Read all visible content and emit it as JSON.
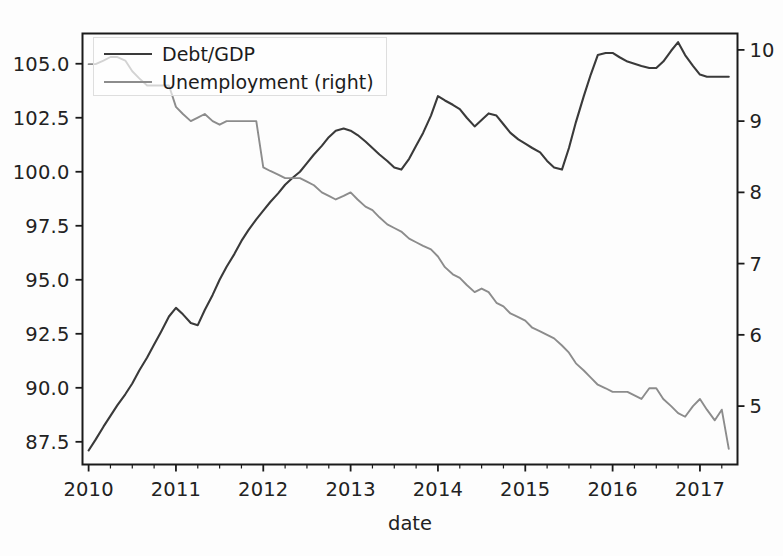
{
  "figure": {
    "background_color": "#fdfdfd",
    "axes_color": "#1a1a1a"
  },
  "legend": {
    "entries": [
      {
        "label": "Debt/GDP",
        "color": "#3a3a3a",
        "swatch": "line-swatch-debt"
      },
      {
        "label": "Unemployment (right)",
        "color": "#8c8c8c",
        "swatch": "line-swatch-unemployment"
      }
    ]
  },
  "axis": {
    "xlabel": "date",
    "xticks": [
      "2010",
      "2011",
      "2012",
      "2013",
      "2014",
      "2015",
      "2016",
      "2017"
    ],
    "yticks_left": [
      "105.0",
      "102.5",
      "100.0",
      "97.5",
      "95.0",
      "92.5",
      "90.0",
      "87.5"
    ],
    "yticks_right": [
      "10",
      "9",
      "8",
      "7",
      "6",
      "5"
    ]
  },
  "chart_data": {
    "type": "line",
    "title": "",
    "xlabel": "date",
    "ylabel": "",
    "ylabel_right": "",
    "grid": false,
    "legend_position": "upper left",
    "xlim": [
      2009.93,
      2017.43
    ],
    "ylim_left": [
      86.45,
      106.4
    ],
    "ylim_right": [
      4.18,
      10.23
    ],
    "xticks": [
      2010,
      2011,
      2012,
      2013,
      2014,
      2015,
      2016,
      2017
    ],
    "yticks_left": [
      87.5,
      90.0,
      92.5,
      95.0,
      97.5,
      100.0,
      102.5,
      105.0
    ],
    "yticks_right": [
      5,
      6,
      7,
      8,
      9,
      10
    ],
    "series": [
      {
        "name": "Debt/GDP",
        "axis": "left",
        "color": "#3a3a3a",
        "x": [
          2010.0,
          2010.08,
          2010.17,
          2010.25,
          2010.33,
          2010.42,
          2010.5,
          2010.58,
          2010.67,
          2010.75,
          2010.83,
          2010.92,
          2011.0,
          2011.08,
          2011.17,
          2011.25,
          2011.33,
          2011.42,
          2011.5,
          2011.58,
          2011.67,
          2011.75,
          2011.83,
          2011.92,
          2012.0,
          2012.08,
          2012.17,
          2012.25,
          2012.33,
          2012.42,
          2012.5,
          2012.58,
          2012.67,
          2012.75,
          2012.83,
          2012.92,
          2013.0,
          2013.08,
          2013.17,
          2013.25,
          2013.33,
          2013.42,
          2013.5,
          2013.58,
          2013.67,
          2013.75,
          2013.83,
          2013.92,
          2014.0,
          2014.08,
          2014.17,
          2014.25,
          2014.33,
          2014.42,
          2014.5,
          2014.58,
          2014.67,
          2014.75,
          2014.83,
          2014.92,
          2015.0,
          2015.08,
          2015.17,
          2015.25,
          2015.33,
          2015.42,
          2015.5,
          2015.58,
          2015.67,
          2015.75,
          2015.83,
          2015.92,
          2016.0,
          2016.08,
          2016.17,
          2016.25,
          2016.33,
          2016.42,
          2016.5,
          2016.58,
          2016.67,
          2016.75,
          2016.83,
          2016.92,
          2017.0,
          2017.08,
          2017.17,
          2017.25,
          2017.33
        ],
        "y": [
          87.1,
          87.6,
          88.2,
          88.7,
          89.2,
          89.7,
          90.2,
          90.8,
          91.4,
          92.0,
          92.6,
          93.3,
          93.7,
          93.4,
          93.0,
          92.9,
          93.6,
          94.3,
          95.0,
          95.6,
          96.2,
          96.8,
          97.3,
          97.8,
          98.2,
          98.6,
          99.0,
          99.4,
          99.7,
          100.0,
          100.4,
          100.8,
          101.2,
          101.6,
          101.9,
          102.0,
          101.9,
          101.7,
          101.4,
          101.1,
          100.8,
          100.5,
          100.2,
          100.1,
          100.6,
          101.2,
          101.8,
          102.6,
          103.5,
          103.3,
          103.1,
          102.9,
          102.5,
          102.1,
          102.4,
          102.7,
          102.6,
          102.2,
          101.8,
          101.5,
          101.3,
          101.1,
          100.9,
          100.5,
          100.2,
          100.1,
          101.1,
          102.3,
          103.5,
          104.5,
          105.4,
          105.5,
          105.5,
          105.3,
          105.1,
          105.0,
          104.9,
          104.8,
          104.8,
          105.1,
          105.6,
          106.0,
          105.4,
          104.9,
          104.5,
          104.4,
          104.4,
          104.4,
          104.4
        ]
      },
      {
        "name": "Unemployment (right)",
        "axis": "right",
        "color": "#8c8c8c",
        "x": [
          2010.0,
          2010.08,
          2010.17,
          2010.25,
          2010.33,
          2010.42,
          2010.5,
          2010.58,
          2010.67,
          2010.75,
          2010.83,
          2010.92,
          2011.0,
          2011.08,
          2011.17,
          2011.25,
          2011.33,
          2011.42,
          2011.5,
          2011.58,
          2011.67,
          2011.75,
          2011.83,
          2011.92,
          2012.0,
          2012.08,
          2012.17,
          2012.25,
          2012.33,
          2012.42,
          2012.5,
          2012.58,
          2012.67,
          2012.75,
          2012.83,
          2012.92,
          2013.0,
          2013.08,
          2013.17,
          2013.25,
          2013.33,
          2013.42,
          2013.5,
          2013.58,
          2013.67,
          2013.75,
          2013.83,
          2013.92,
          2014.0,
          2014.08,
          2014.17,
          2014.25,
          2014.33,
          2014.42,
          2014.5,
          2014.58,
          2014.67,
          2014.75,
          2014.83,
          2014.92,
          2015.0,
          2015.08,
          2015.17,
          2015.25,
          2015.33,
          2015.42,
          2015.5,
          2015.58,
          2015.67,
          2015.75,
          2015.83,
          2015.92,
          2016.0,
          2016.08,
          2016.17,
          2016.25,
          2016.33,
          2016.42,
          2016.5,
          2016.58,
          2016.67,
          2016.75,
          2016.83,
          2016.92,
          2017.0,
          2017.08,
          2017.17,
          2017.25,
          2017.33
        ],
        "y": [
          9.8,
          9.8,
          9.85,
          9.9,
          9.9,
          9.85,
          9.7,
          9.6,
          9.5,
          9.5,
          9.5,
          9.5,
          9.2,
          9.1,
          9.0,
          9.05,
          9.1,
          9.0,
          8.95,
          9.0,
          9.0,
          9.0,
          9.0,
          9.0,
          8.35,
          8.3,
          8.25,
          8.2,
          8.2,
          8.2,
          8.15,
          8.1,
          8.0,
          7.95,
          7.9,
          7.95,
          8.0,
          7.9,
          7.8,
          7.75,
          7.65,
          7.55,
          7.5,
          7.45,
          7.35,
          7.3,
          7.25,
          7.2,
          7.1,
          6.95,
          6.85,
          6.8,
          6.7,
          6.6,
          6.65,
          6.6,
          6.45,
          6.4,
          6.3,
          6.25,
          6.2,
          6.1,
          6.05,
          6.0,
          5.95,
          5.85,
          5.75,
          5.6,
          5.5,
          5.4,
          5.3,
          5.25,
          5.2,
          5.2,
          5.2,
          5.15,
          5.1,
          5.25,
          5.25,
          5.1,
          5.0,
          4.9,
          4.85,
          5.0,
          5.1,
          4.95,
          4.8,
          4.95,
          4.4
        ]
      }
    ]
  }
}
